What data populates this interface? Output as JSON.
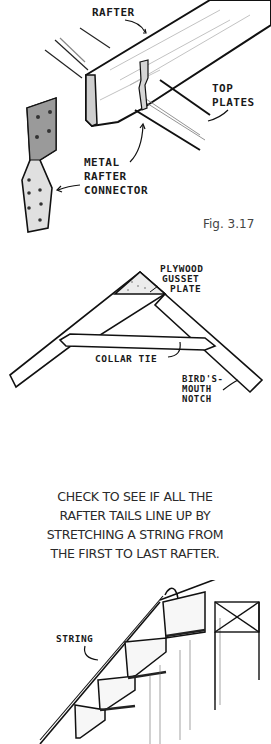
{
  "figure_1": {
    "labels": {
      "rafter": "RAFTER",
      "top_plates_line1": "TOP",
      "top_plates_line2": "PLATES",
      "connector_line1": "METAL",
      "connector_line2": "RAFTER",
      "connector_line3": "CONNECTOR"
    },
    "caption": "Fig. 3.17"
  },
  "figure_2": {
    "labels": {
      "gusset_line1": "PLYWOOD",
      "gusset_line2": "GUSSET",
      "gusset_line3": "PLATE",
      "collar_tie": "COLLAR TIE",
      "notch_line1": "BIRD'S-",
      "notch_line2": "MOUTH",
      "notch_line3": "NOTCH"
    }
  },
  "instruction": {
    "lines": [
      "CHECK TO SEE IF ALL THE",
      "RAFTER TAILS LINE UP BY",
      "STRETCHING A STRING FROM",
      "THE FIRST TO LAST RAFTER."
    ]
  },
  "figure_3": {
    "labels": {
      "string": "STRING"
    }
  }
}
